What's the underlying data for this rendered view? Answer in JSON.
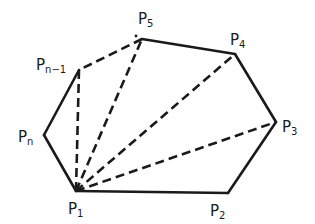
{
  "diagram": {
    "type": "polygon-triangulation",
    "colors": {
      "stroke": "#1a1a1a",
      "background": "#ffffff"
    },
    "vertices": [
      {
        "id": "P1",
        "base": "P",
        "sub": "1",
        "x": 76,
        "y": 191,
        "lx": 68,
        "ly": 214
      },
      {
        "id": "P2",
        "base": "P",
        "sub": "2",
        "x": 228,
        "y": 193,
        "lx": 210,
        "ly": 216
      },
      {
        "id": "P3",
        "base": "P",
        "sub": "3",
        "x": 276,
        "y": 122,
        "lx": 282,
        "ly": 132
      },
      {
        "id": "P4",
        "base": "P",
        "sub": "4",
        "x": 235,
        "y": 54,
        "lx": 230,
        "ly": 45
      },
      {
        "id": "P5",
        "base": "P",
        "sub": "5",
        "x": 142,
        "y": 39,
        "lx": 138,
        "ly": 24
      },
      {
        "id": "Pn-1",
        "base": "P",
        "sub": "n−1",
        "x": 79,
        "y": 70,
        "lx": 36,
        "ly": 70
      },
      {
        "id": "Pn",
        "base": "P",
        "sub": "n",
        "x": 44,
        "y": 135,
        "lx": 18,
        "ly": 142
      }
    ],
    "solid_edges": [
      [
        "P1",
        "P2"
      ],
      [
        "P2",
        "P3"
      ],
      [
        "P3",
        "P4"
      ],
      [
        "P4",
        "P5"
      ],
      [
        "Pn-1",
        "Pn"
      ],
      [
        "Pn",
        "P1"
      ]
    ],
    "dashed_edges": [
      [
        "P5",
        "Pn-1"
      ]
    ],
    "diagonals_from_P1": [
      "P3",
      "P4",
      "P5",
      "Pn-1"
    ],
    "ellipsis_dot": {
      "x": 136,
      "y": 36
    },
    "labels": {
      "P1": {
        "base": "P",
        "sub": "1"
      },
      "P2": {
        "base": "P",
        "sub": "2"
      },
      "P3": {
        "base": "P",
        "sub": "3"
      },
      "P4": {
        "base": "P",
        "sub": "4"
      },
      "P5": {
        "base": "P",
        "sub": "5"
      },
      "Pn1": {
        "base": "P",
        "sub": "n−1"
      },
      "Pn": {
        "base": "P",
        "sub": "n"
      }
    }
  }
}
